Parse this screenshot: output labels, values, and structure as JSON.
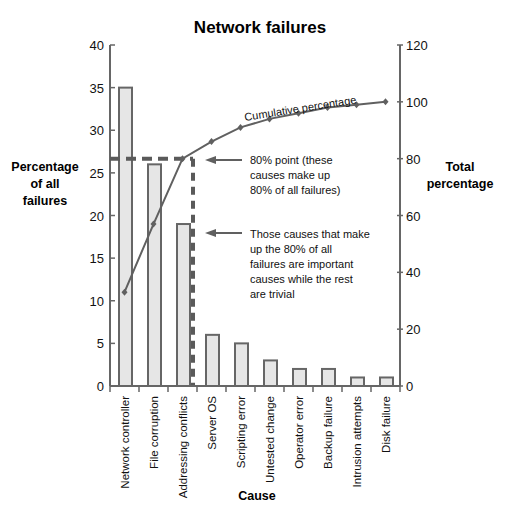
{
  "chart_data": {
    "type": "bar",
    "title": "Network failures",
    "xlabel": "Cause",
    "ylabel": "Percentage of all failures",
    "y2label": "Total percentage",
    "ylim": [
      0,
      40
    ],
    "y2lim": [
      0,
      120
    ],
    "yticks": [
      0,
      5,
      10,
      15,
      20,
      25,
      30,
      35,
      40
    ],
    "y2ticks": [
      0,
      20,
      40,
      60,
      80,
      100,
      120
    ],
    "grid": false,
    "categories": [
      "Network controller",
      "File corruption",
      "Addressing conflicts",
      "Server OS",
      "Scripting error",
      "Untested change",
      "Operator error",
      "Backup failure",
      "Intrusion attempts",
      "Disk failure"
    ],
    "series": [
      {
        "name": "Percentage of all failures",
        "type": "bar",
        "axis": "left",
        "values": [
          35,
          26,
          19,
          6,
          5,
          3,
          2,
          2,
          1,
          1
        ]
      },
      {
        "name": "Cumulative percentage",
        "type": "line",
        "axis": "right",
        "values": [
          33,
          57,
          80,
          86,
          91,
          94,
          96,
          98,
          99,
          100
        ]
      }
    ],
    "annotations": [
      {
        "text": "Cumulative percentage",
        "target": "line"
      },
      {
        "text": "80% point (these causes make up 80% of all failures)",
        "target": "80% cumulative point"
      },
      {
        "text": "Those causes that make up the 80% of all failures are important causes while the rest are trivial",
        "target": "80% cutoff vertical line"
      }
    ],
    "reference_lines": [
      {
        "orientation": "horizontal",
        "value_right_axis": 80,
        "style": "dashed"
      },
      {
        "orientation": "vertical",
        "after_category": "Addressing conflicts",
        "style": "dashed"
      }
    ]
  },
  "labels": {
    "title": "Network failures",
    "left_axis": [
      "Percentage",
      "of all",
      "failures"
    ],
    "right_axis": [
      "Total",
      "percentage"
    ],
    "x_axis": "Cause",
    "line_label": "Cumulative percentage",
    "note_80": [
      "80% point (these",
      "causes make up",
      "80% of all failures)"
    ],
    "note_vital": [
      "Those causes that make",
      "up the 80% of all",
      "failures are important",
      "causes while the rest",
      "are trivial"
    ]
  },
  "colors": {
    "bar_fill": "#e6e6e6",
    "bar_stroke": "#666666",
    "line": "#606060",
    "axis": "#666666",
    "dash": "#5a5a5a"
  }
}
